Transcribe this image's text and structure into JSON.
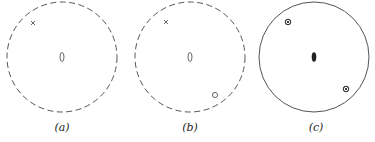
{
  "figure": {
    "panels": [
      {
        "label": "(a)",
        "circle": {
          "cx": 62,
          "cy": 57,
          "r": 55,
          "style": "dashed"
        },
        "center_symbol": {
          "type": "open-lens",
          "x": 62,
          "y": 57
        },
        "points": [
          {
            "symbol": "cross",
            "x": 33,
            "y": 23
          }
        ]
      },
      {
        "label": "(b)",
        "circle": {
          "cx": 190,
          "cy": 57,
          "r": 55,
          "style": "dashed"
        },
        "center_symbol": {
          "type": "open-lens",
          "x": 190,
          "y": 57
        },
        "points": [
          {
            "symbol": "cross",
            "x": 166,
            "y": 22
          },
          {
            "symbol": "open-circle",
            "x": 215,
            "y": 95
          }
        ]
      },
      {
        "label": "(c)",
        "circle": {
          "cx": 314,
          "cy": 57,
          "r": 55,
          "style": "solid"
        },
        "center_symbol": {
          "type": "filled-lens",
          "x": 314,
          "y": 57
        },
        "points": [
          {
            "symbol": "circled-cross",
            "x": 288,
            "y": 22
          },
          {
            "symbol": "circled-cross",
            "x": 346,
            "y": 89
          }
        ]
      }
    ],
    "colors": {
      "stroke": "#555555",
      "fill": "#222222",
      "background": "#ffffff"
    }
  }
}
